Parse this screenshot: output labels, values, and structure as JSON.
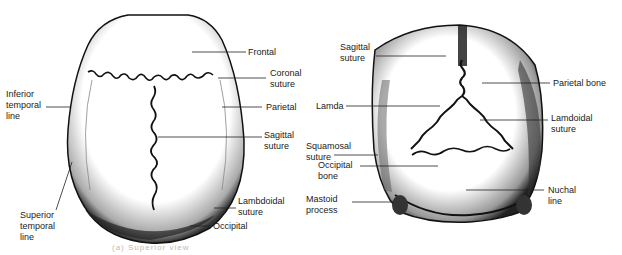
{
  "figures": [
    {
      "id": "skull-superior-view",
      "labels": {
        "frontal": "Frontal",
        "coronal_suture": "Coronal\nsuture",
        "inferior_temporal_line": "Inferior\ntemporal\nline",
        "parietal": "Parietal",
        "sagittal_suture": "Sagittal\nsuture",
        "superior_temporal_line": "Superior\ntemporal\nline",
        "lambdoidal_suture": "Lambdoidal\nsuture",
        "occipital": "Occipital"
      }
    },
    {
      "id": "skull-posterior-view",
      "labels": {
        "sagittal_suture": "Sagittal\nsuture",
        "parietal_bone": "Parietal bone",
        "lamda": "Lamda",
        "lamdoidal_suture": "Lamdoidal\nsuture",
        "squamosal_suture": "Squamosal\nsuture",
        "occipital_bone": "Occipital\nbone",
        "mastoid_process": "Mastoid\nprocess",
        "nuchal_line": "Nuchal\nline"
      }
    }
  ],
  "caption": "(a) Superior view"
}
